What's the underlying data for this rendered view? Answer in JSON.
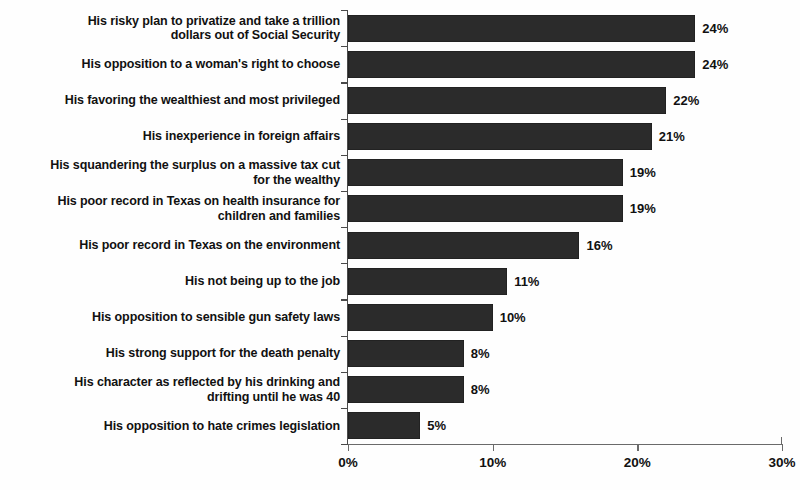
{
  "chart": {
    "title": "",
    "background_color": "#fefefe",
    "bar_color": "#2b2b2b",
    "axis_color": "#6a6a6a",
    "text_color": "#111111"
  },
  "chart_data": {
    "type": "bar",
    "orientation": "horizontal",
    "title": "",
    "xlabel": "",
    "ylabel": "",
    "xlim": [
      0,
      30
    ],
    "grid": false,
    "legend": null,
    "value_suffix": "%",
    "xticks": [
      "0%",
      "10%",
      "20%",
      "30%"
    ],
    "xtick_values": [
      0,
      10,
      20,
      30
    ],
    "categories": [
      "His risky plan to privatize and take a trillion\ndollars out of Social Security",
      "His opposition to a woman's right to choose",
      "His favoring the wealthiest and most privileged",
      "His inexperience in foreign affairs",
      "His squandering the surplus on a massive tax cut\nfor the wealthy",
      "His poor record in Texas on health insurance for\nchildren and families",
      "His poor record in Texas on the environment",
      "His not being up to the job",
      "His opposition to sensible gun safety laws",
      "His strong support for the death penalty",
      "His character as reflected by his drinking and\ndrifting until he was 40",
      "His opposition to hate crimes legislation"
    ],
    "values": [
      24,
      24,
      22,
      21,
      19,
      19,
      16,
      11,
      10,
      8,
      8,
      5
    ],
    "data_labels": [
      "24%",
      "24%",
      "22%",
      "21%",
      "19%",
      "19%",
      "16%",
      "11%",
      "10%",
      "8%",
      "8%",
      "5%"
    ]
  }
}
